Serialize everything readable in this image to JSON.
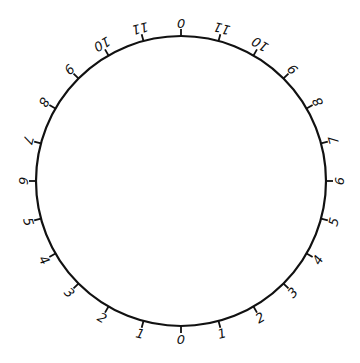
{
  "dial": {
    "center": [
      181,
      181
    ],
    "radius": 145,
    "tick_length": 7,
    "label_radius": 158,
    "stroke_color": "#111111",
    "tick_count": 24,
    "labels_clockwise_from_top": [
      "0",
      "11",
      "10",
      "9",
      "8",
      "7",
      "6",
      "5",
      "4",
      "3",
      "2",
      "1",
      "0",
      "1",
      "2",
      "3",
      "4",
      "5",
      "6",
      "7",
      "8",
      "9",
      "10",
      "11"
    ]
  }
}
